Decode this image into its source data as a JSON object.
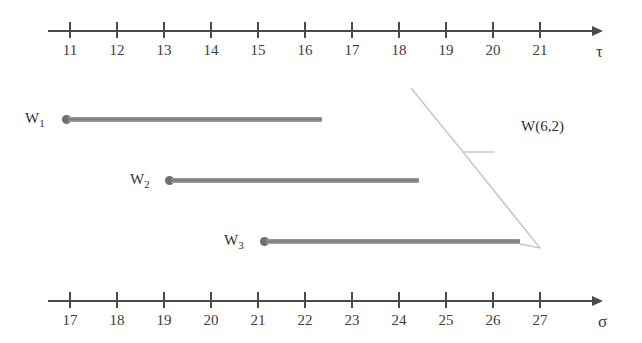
{
  "figure": {
    "background_color": "#ffffff",
    "line_color": "#4a4a4a",
    "bar_color": "#8a8a8a"
  },
  "top_axis": {
    "name": "τ",
    "tick_labels": [
      "11",
      "12",
      "13",
      "14",
      "15",
      "16",
      "17",
      "18",
      "19",
      "20",
      "21"
    ]
  },
  "bottom_axis": {
    "name": "σ",
    "tick_labels": [
      "17",
      "18",
      "19",
      "20",
      "21",
      "22",
      "23",
      "24",
      "25",
      "26",
      "27"
    ]
  },
  "windows": [
    {
      "label": "W",
      "sub": "1",
      "start": "11",
      "end": "16"
    },
    {
      "label": "W",
      "sub": "2",
      "start": "13",
      "end": "18"
    },
    {
      "label": "W",
      "sub": "3",
      "start": "15",
      "end": "20"
    }
  ],
  "callout": {
    "text": "W(6,2)"
  }
}
